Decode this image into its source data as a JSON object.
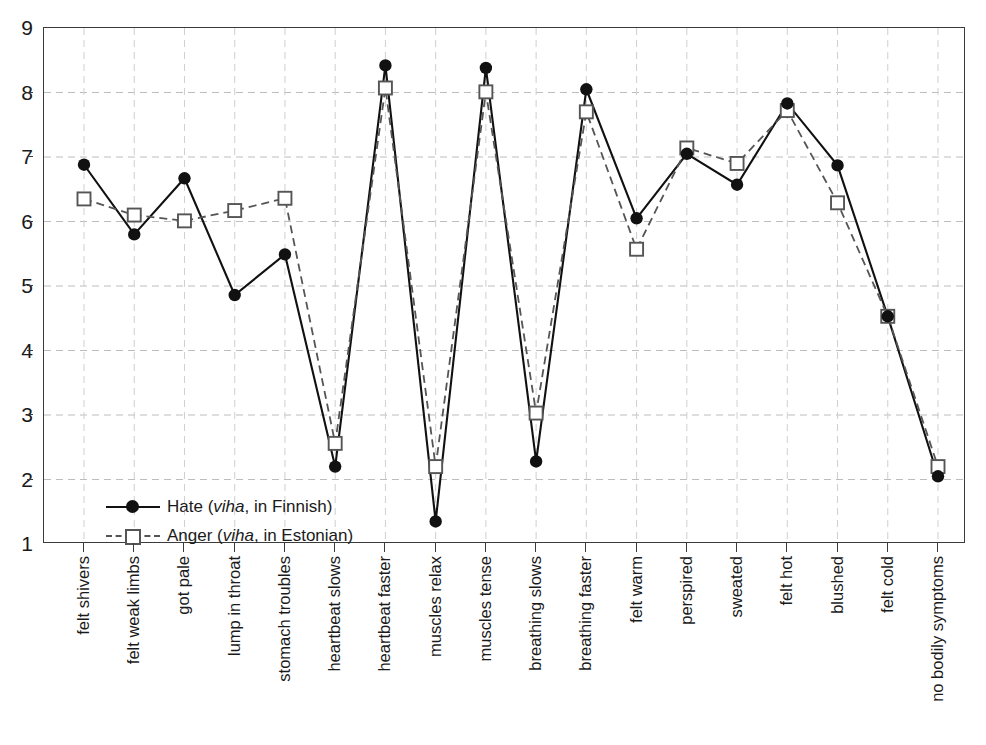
{
  "chart_data": {
    "type": "line",
    "title": "",
    "xlabel": "",
    "ylabel": "",
    "ylim": [
      1,
      9
    ],
    "yticks": [
      1,
      2,
      3,
      4,
      5,
      6,
      7,
      8,
      9
    ],
    "grid": true,
    "legend_position": "lower-left-inside",
    "categories": [
      "felt shivers",
      "felt weak limbs",
      "got pale",
      "lump in throat",
      "stomach troubles",
      "heartbeat slows",
      "heartbeat faster",
      "muscles relax",
      "muscles tense",
      "breathing slows",
      "breathing faster",
      "felt warm",
      "perspired",
      "sweated",
      "felt hot",
      "blushed",
      "felt cold",
      "no bodily symptoms"
    ],
    "series": [
      {
        "name": "Hate (viha, in Finnish)",
        "marker": "filled-circle",
        "linestyle": "solid",
        "color": "#111111",
        "values": [
          6.88,
          5.8,
          6.67,
          4.86,
          5.49,
          2.2,
          8.42,
          1.35,
          8.38,
          2.28,
          8.05,
          6.05,
          7.05,
          6.57,
          7.83,
          6.87,
          4.53,
          2.05
        ]
      },
      {
        "name": "Anger (viha, in Estonian)",
        "marker": "open-square",
        "linestyle": "dashed",
        "color": "#555555",
        "values": [
          6.35,
          6.1,
          6.01,
          6.17,
          6.36,
          2.56,
          8.07,
          2.2,
          8.01,
          3.03,
          7.7,
          5.57,
          7.14,
          6.9,
          7.72,
          6.29,
          4.53,
          2.2
        ]
      }
    ]
  },
  "legend": {
    "items": [
      {
        "prefix": "Hate (",
        "italic": "viha",
        "suffix": ", in Finnish)"
      },
      {
        "prefix": "Anger (",
        "italic": "viha",
        "suffix": ", in Estonian)"
      }
    ]
  }
}
